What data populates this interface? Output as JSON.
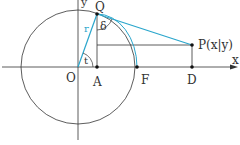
{
  "diagram": {
    "points": {
      "O": "O",
      "A": "A",
      "F": "F",
      "D": "D",
      "Q": "Q",
      "P": "P(x|y)"
    },
    "axes": {
      "x": "x",
      "y": "y"
    },
    "symbols": {
      "radius": "r",
      "angle_t": "t",
      "angle_delta": "δ"
    },
    "colors": {
      "line": "#333333",
      "accent": "#2aa6cc"
    }
  }
}
